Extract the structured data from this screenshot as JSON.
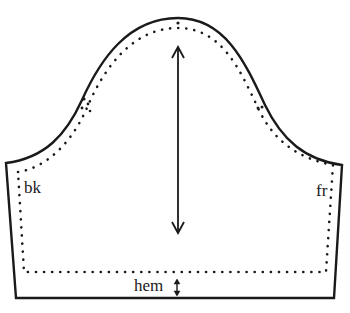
{
  "diagram": {
    "type": "sewing-pattern",
    "piece": "sleeve",
    "labels": {
      "back": "bk",
      "front": "fr",
      "hem": "hem"
    },
    "elements": {
      "cut_line": "solid outline",
      "seam_line": "dotted line",
      "grainline": "double-headed vertical arrow",
      "hem_depth": "small double-headed arrow"
    },
    "colors": {
      "line": "#1a1a1a",
      "background": "#ffffff"
    }
  }
}
